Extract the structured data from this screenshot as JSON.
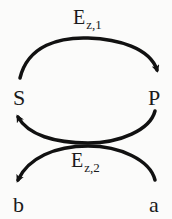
{
  "diagram": {
    "type": "reaction-scheme",
    "nodes": {
      "S": {
        "label": "S"
      },
      "P": {
        "label": "P"
      },
      "b": {
        "label": "b"
      },
      "a": {
        "label": "a"
      }
    },
    "edges": [
      {
        "from": "S",
        "to": "P",
        "label_main": "E",
        "label_sub": "z,1",
        "shape": "arc-over"
      },
      {
        "from": "P",
        "to": "S",
        "label_main": "E",
        "label_sub": "z,2",
        "shape": "coupled-crossing"
      },
      {
        "from": "a",
        "to": "b",
        "label_main": "E",
        "label_sub": "z,2",
        "shape": "coupled-crossing"
      }
    ],
    "top_label": {
      "main": "E",
      "sub": "z,1"
    },
    "bottom_label": {
      "main": "E",
      "sub": "z,2"
    },
    "colors": {
      "stroke": "#111111",
      "text": "#1a1a1a",
      "background": "#fbfbfa"
    }
  }
}
